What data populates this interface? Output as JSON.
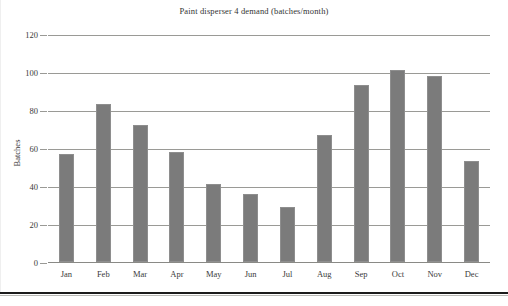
{
  "chart_data": {
    "type": "bar",
    "title": "Paint disperser 4 demand (batches/month)",
    "xlabel": "",
    "ylabel": "Batches",
    "categories": [
      "Jan",
      "Feb",
      "Mar",
      "Apr",
      "May",
      "Jun",
      "Jul",
      "Aug",
      "Sep",
      "Oct",
      "Nov",
      "Dec"
    ],
    "values": [
      57,
      83,
      72,
      58,
      41,
      36,
      29,
      67,
      93,
      101,
      98,
      53
    ],
    "ylim": [
      0,
      120
    ],
    "ytick_labels": [
      "120",
      "100",
      "80",
      "60",
      "40",
      "20",
      "0"
    ],
    "ytick_values": [
      120,
      100,
      80,
      60,
      40,
      20,
      0
    ],
    "grid": "horizontal",
    "legend": "none",
    "bar_color": "#7b7b7b",
    "gridline_color": "#9a9a96",
    "text_color": "#3a3a3a",
    "background": "#ffffff"
  }
}
